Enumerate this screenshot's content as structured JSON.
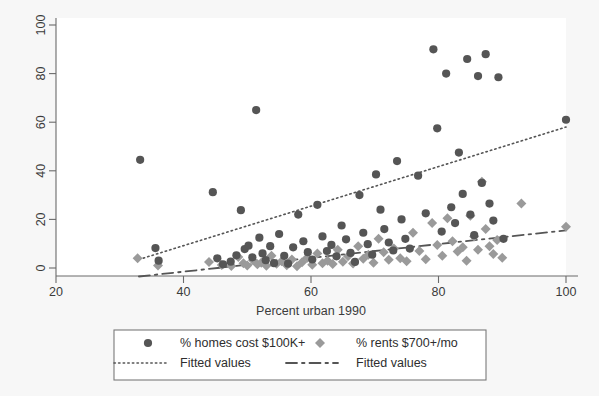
{
  "chart_data": {
    "type": "scatter",
    "title": "",
    "xlabel": "Percent urban 1990",
    "ylabel": "",
    "xlim": [
      20,
      100
    ],
    "ylim": [
      0,
      100
    ],
    "xticks": [
      20,
      40,
      60,
      80,
      100
    ],
    "yticks": [
      0,
      20,
      40,
      60,
      80,
      100
    ],
    "grid": false,
    "legend_position": "bottom",
    "series": [
      {
        "name": "% homes cost $100K+",
        "marker": "circle",
        "color": "#555555",
        "points": [
          [
            33.2,
            44.5
          ],
          [
            35.6,
            8.2
          ],
          [
            36.1,
            3.0
          ],
          [
            44.6,
            31.2
          ],
          [
            45.3,
            4.0
          ],
          [
            46.2,
            1.5
          ],
          [
            47.4,
            2.6
          ],
          [
            48.3,
            5.2
          ],
          [
            49.0,
            23.8
          ],
          [
            49.6,
            7.8
          ],
          [
            50.2,
            9.2
          ],
          [
            50.8,
            4.4
          ],
          [
            51.4,
            65.0
          ],
          [
            51.9,
            12.5
          ],
          [
            52.4,
            6.0
          ],
          [
            52.9,
            3.2
          ],
          [
            53.6,
            9.0
          ],
          [
            54.2,
            2.0
          ],
          [
            55.0,
            14.0
          ],
          [
            55.8,
            5.0
          ],
          [
            56.4,
            1.8
          ],
          [
            57.2,
            8.5
          ],
          [
            58.0,
            22.0
          ],
          [
            58.8,
            11.0
          ],
          [
            59.5,
            6.5
          ],
          [
            60.2,
            3.5
          ],
          [
            61.0,
            26.0
          ],
          [
            61.8,
            13.0
          ],
          [
            62.5,
            7.0
          ],
          [
            63.2,
            9.5
          ],
          [
            64.0,
            4.8
          ],
          [
            64.8,
            17.5
          ],
          [
            65.5,
            11.8
          ],
          [
            66.2,
            6.2
          ],
          [
            66.9,
            2.5
          ],
          [
            67.6,
            30.0
          ],
          [
            68.2,
            14.5
          ],
          [
            68.9,
            9.8
          ],
          [
            69.6,
            5.5
          ],
          [
            70.2,
            38.5
          ],
          [
            70.9,
            24.0
          ],
          [
            71.5,
            16.0
          ],
          [
            72.2,
            10.5
          ],
          [
            72.9,
            7.2
          ],
          [
            73.5,
            44.0
          ],
          [
            74.2,
            20.0
          ],
          [
            74.8,
            12.0
          ],
          [
            75.5,
            8.0
          ],
          [
            76.8,
            38.0
          ],
          [
            78.0,
            22.5
          ],
          [
            79.2,
            90.0
          ],
          [
            79.8,
            57.5
          ],
          [
            80.5,
            15.0
          ],
          [
            81.2,
            80.0
          ],
          [
            82.0,
            25.0
          ],
          [
            82.6,
            18.5
          ],
          [
            83.2,
            47.5
          ],
          [
            83.8,
            30.5
          ],
          [
            84.5,
            86.0
          ],
          [
            85.0,
            22.0
          ],
          [
            85.6,
            13.5
          ],
          [
            86.2,
            79.0
          ],
          [
            86.8,
            35.0
          ],
          [
            87.4,
            88.0
          ],
          [
            88.0,
            26.5
          ],
          [
            88.6,
            19.5
          ],
          [
            89.4,
            78.5
          ],
          [
            90.2,
            12.0
          ],
          [
            100.0,
            61.0
          ]
        ]
      },
      {
        "name": "% rents $700+/mo",
        "marker": "diamond",
        "color": "#9a9a9a",
        "points": [
          [
            32.8,
            4.0
          ],
          [
            36.0,
            1.0
          ],
          [
            44.0,
            2.5
          ],
          [
            46.0,
            1.2
          ],
          [
            47.5,
            0.8
          ],
          [
            48.6,
            4.5
          ],
          [
            49.4,
            2.0
          ],
          [
            50.0,
            1.0
          ],
          [
            50.9,
            3.2
          ],
          [
            51.6,
            1.5
          ],
          [
            52.2,
            2.2
          ],
          [
            53.0,
            0.9
          ],
          [
            53.8,
            5.0
          ],
          [
            54.6,
            1.8
          ],
          [
            55.4,
            2.8
          ],
          [
            56.2,
            1.1
          ],
          [
            57.0,
            3.5
          ],
          [
            57.8,
            0.7
          ],
          [
            58.6,
            2.4
          ],
          [
            59.4,
            4.2
          ],
          [
            60.2,
            1.3
          ],
          [
            61.0,
            6.0
          ],
          [
            61.8,
            2.0
          ],
          [
            62.6,
            3.0
          ],
          [
            63.4,
            1.6
          ],
          [
            64.2,
            7.5
          ],
          [
            65.0,
            2.6
          ],
          [
            65.8,
            4.8
          ],
          [
            66.6,
            1.9
          ],
          [
            67.4,
            9.0
          ],
          [
            68.2,
            3.8
          ],
          [
            69.0,
            5.5
          ],
          [
            69.8,
            2.2
          ],
          [
            70.6,
            12.0
          ],
          [
            71.4,
            6.5
          ],
          [
            72.2,
            3.4
          ],
          [
            73.0,
            8.0
          ],
          [
            74.0,
            4.0
          ],
          [
            75.0,
            2.8
          ],
          [
            76.0,
            14.5
          ],
          [
            77.0,
            7.0
          ],
          [
            78.0,
            3.6
          ],
          [
            79.0,
            18.5
          ],
          [
            79.8,
            9.5
          ],
          [
            80.6,
            5.0
          ],
          [
            81.4,
            20.5
          ],
          [
            82.2,
            11.0
          ],
          [
            83.0,
            6.8
          ],
          [
            83.8,
            8.5
          ],
          [
            84.4,
            3.0
          ],
          [
            85.0,
            21.5
          ],
          [
            85.6,
            13.0
          ],
          [
            86.2,
            7.5
          ],
          [
            86.8,
            35.5
          ],
          [
            87.4,
            16.0
          ],
          [
            88.0,
            9.0
          ],
          [
            88.6,
            5.8
          ],
          [
            89.2,
            11.5
          ],
          [
            90.0,
            4.2
          ],
          [
            93.0,
            26.5
          ],
          [
            100.0,
            17.0
          ]
        ]
      }
    ],
    "fit_lines": [
      {
        "name": "Fitted values",
        "style": "dotted",
        "color": "#555555",
        "x0": 33.0,
        "y0": 3.5,
        "x1": 100.0,
        "y1": 58.0
      },
      {
        "name": "Fitted values",
        "style": "dashed",
        "color": "#555555",
        "x0": 33.0,
        "y0": -3.5,
        "x1": 100.0,
        "y1": 15.5
      }
    ]
  },
  "axis": {
    "x_label": "Percent urban 1990",
    "x_ticks": [
      "20",
      "40",
      "60",
      "80",
      "100"
    ],
    "y_ticks": [
      "0",
      "20",
      "40",
      "60",
      "80",
      "100"
    ]
  },
  "legend": {
    "items": [
      {
        "label": "% homes cost $100K+",
        "marker": "circle-marker"
      },
      {
        "label": "% rents $700+/mo",
        "marker": "diamond-marker"
      },
      {
        "label": "Fitted values",
        "marker": "dotted-line"
      },
      {
        "label": "Fitted values",
        "marker": "dashdot-line"
      }
    ]
  }
}
